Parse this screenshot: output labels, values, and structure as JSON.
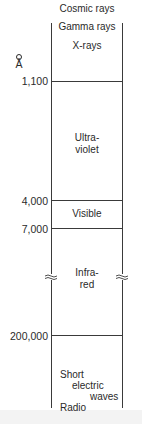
{
  "diagram": {
    "unit": "Å",
    "top_labels": [
      "Cosmic rays",
      "Gamma rays",
      "X-rays"
    ],
    "ticks": [
      {
        "label": "1,100",
        "value": 1100
      },
      {
        "label": "4,000",
        "value": 4000
      },
      {
        "label": "7,000",
        "value": 7000
      },
      {
        "label": "200,000",
        "value": 200000
      }
    ],
    "bands": [
      {
        "name": "ultraviolet",
        "line1": "Ultra-",
        "line2": "violet"
      },
      {
        "name": "visible",
        "line1": "Visible"
      },
      {
        "name": "infrared",
        "line1": "Infra-",
        "line2": "red"
      }
    ],
    "bottom_labels": {
      "short": "Short",
      "electric": "electric",
      "waves": "waves",
      "radio": "Radio"
    },
    "scale_break": "≈",
    "colors": {
      "line": "#3a3a3a",
      "text": "#2a2a2a",
      "background": "#ffffff"
    }
  }
}
